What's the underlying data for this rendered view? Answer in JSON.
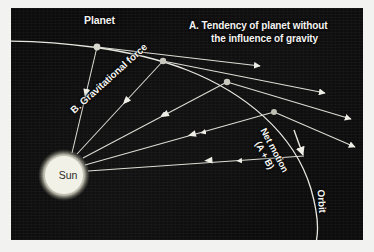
{
  "figure": {
    "background_color": "#0c0c0c",
    "ink_color": "#f4f4f2",
    "panel": {
      "x": 11,
      "y": 8,
      "width": 352,
      "height": 232
    }
  },
  "labels": {
    "planet": "Planet",
    "tendency_line1": "A. Tendency of planet without",
    "tendency_line2": "the influence of gravity",
    "gravitational_force": "B. Gravitational force",
    "net_motion_line1": "Net motion",
    "net_motion_line2": "(A + B)",
    "orbit": "Orbit",
    "sun": "Sun"
  },
  "chart_data": {
    "type": "diagram",
    "bodies": [
      {
        "name": "Sun",
        "type": "star",
        "cx": 53,
        "cy": 167,
        "r": 20,
        "color": "#f1f0e6",
        "label": "Sun"
      },
      {
        "name": "Planet",
        "type": "planet",
        "cx": 86,
        "cy": 39,
        "r": 3.4,
        "label": "Planet"
      },
      {
        "name": "Planet position 2",
        "type": "planet",
        "cx": 152,
        "cy": 53,
        "r": 3.2,
        "label": ""
      },
      {
        "name": "Planet position 3",
        "type": "planet",
        "cx": 216,
        "cy": 74,
        "r": 3.2,
        "label": ""
      },
      {
        "name": "Planet position 4",
        "type": "planet",
        "cx": 263,
        "cy": 104,
        "r": 3.0,
        "label": ""
      }
    ],
    "orbit_curve": {
      "name": "Orbit",
      "stroke": "#e8e7e0",
      "stroke_width": 1.3,
      "path": "M -6 33 C 46 33, 120 40, 176 62 C 232 84, 283 124, 300 181 C 308 209, 308 226, 304 238"
    },
    "tendency_arrows": [
      {
        "from": [
          86,
          39
        ],
        "to": [
          252,
          58
        ],
        "label_ref": "A"
      },
      {
        "from": [
          152,
          53
        ],
        "to": [
          318,
          84
        ],
        "label_ref": "A"
      },
      {
        "from": [
          216,
          74
        ],
        "to": [
          344,
          110
        ],
        "label_ref": "A"
      },
      {
        "from": [
          263,
          104
        ],
        "to": [
          348,
          138
        ],
        "label_ref": "A"
      }
    ],
    "gravity_arrows": [
      {
        "from": [
          86,
          39
        ],
        "to": [
          60,
          146
        ],
        "label_ref": "B"
      },
      {
        "from": [
          152,
          53
        ],
        "to": [
          66,
          146
        ],
        "label_ref": "B"
      },
      {
        "from": [
          216,
          74
        ],
        "to": [
          72,
          150
        ],
        "label_ref": "B"
      },
      {
        "from": [
          263,
          104
        ],
        "to": [
          74,
          156
        ],
        "label_ref": "B"
      },
      {
        "from": [
          291,
          145
        ],
        "to": [
          76,
          162
        ],
        "label_ref": "B"
      }
    ],
    "annotations": [
      {
        "text": "Planet",
        "x": 84,
        "y": 12,
        "rotation": 0
      },
      {
        "text": "A. Tendency of planet without the influence of gravity",
        "x": 178,
        "y": 16,
        "rotation": 0
      },
      {
        "text": "B. Gravitational force",
        "x": 61,
        "y": 98,
        "rotation": -42
      },
      {
        "text": "Net motion (A + B)",
        "x": 254,
        "y": 112,
        "rotation": 62
      },
      {
        "text": "Orbit",
        "x": 310,
        "y": 176,
        "rotation": 86
      },
      {
        "text": "Sun",
        "x": 53,
        "y": 167,
        "rotation": 0
      }
    ]
  }
}
